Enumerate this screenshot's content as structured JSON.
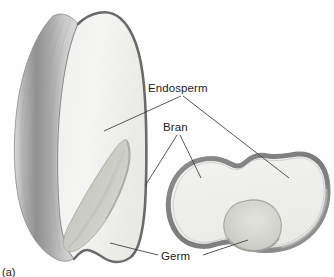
{
  "figure": {
    "caption": "(a)",
    "background_color": "#fefefe"
  },
  "labels": [
    {
      "id": "endosperm",
      "text": "Endosperm",
      "x": 148,
      "y": 92
    },
    {
      "id": "bran",
      "text": "Bran",
      "x": 163,
      "y": 131
    },
    {
      "id": "germ",
      "text": "Germ",
      "x": 161,
      "y": 260
    }
  ],
  "colors": {
    "bran_outline": "#7d7d7d",
    "bran_surface_dark": "#8d8d8d",
    "bran_surface_light": "#d8d8d8",
    "endosperm_fill": "#f2f2f0",
    "germ_fill": "#cfcfcb",
    "germ_outline": "#9a9a9a",
    "leader_line": "#3a3a3a",
    "label_text": "#1d1d1d"
  },
  "parts": [
    {
      "id": "whole-kernel",
      "name": "whole kernel longitudinal view",
      "side": "left"
    },
    {
      "id": "cross-section",
      "name": "kernel cross section",
      "side": "right"
    }
  ]
}
